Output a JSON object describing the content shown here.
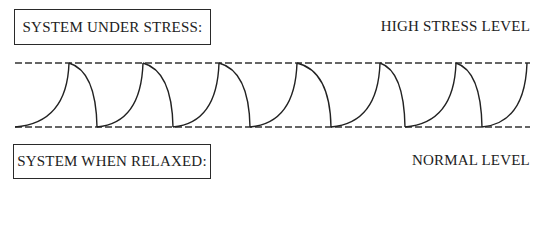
{
  "labels": {
    "stress_box": "SYSTEM UNDER STRESS:",
    "relaxed_box": "SYSTEM WHEN RELAXED:",
    "high_level": "HIGH STRESS LEVEL",
    "normal_level": "NORMAL LEVEL"
  },
  "diagram": {
    "top_line_y": 63,
    "bottom_line_y": 127,
    "line_x_start": 15,
    "line_x_end": 530,
    "line_color": "#333333",
    "peaks_x": [
      69,
      143,
      219,
      297,
      380,
      456,
      527
    ],
    "troughs_x": [
      15,
      97,
      173,
      250,
      331,
      405,
      482
    ]
  }
}
